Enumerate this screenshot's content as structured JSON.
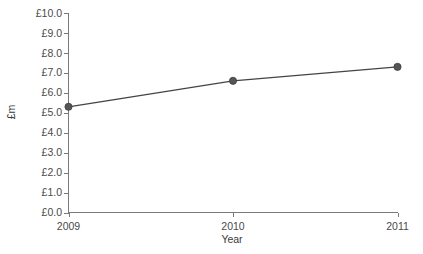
{
  "chart_data": {
    "type": "line",
    "title": "",
    "xlabel": "Year",
    "ylabel": "£m",
    "categories": [
      "2009",
      "2010",
      "2011"
    ],
    "x": [
      2009,
      2010,
      2011
    ],
    "values": [
      5.3,
      6.6,
      7.3
    ],
    "series": [
      {
        "name": "£m",
        "values": [
          5.3,
          6.6,
          7.3
        ]
      }
    ],
    "ylim": [
      0.0,
      10.0
    ],
    "ytick_step": 1.0,
    "ytick_labels": [
      "£10.0",
      "£9.0",
      "£8.0",
      "£7.0",
      "£6.0",
      "£5.0",
      "£4.0",
      "£3.0",
      "£2.0",
      "£1.0",
      "£0.0"
    ],
    "ytick_values": [
      10.0,
      9.0,
      8.0,
      7.0,
      6.0,
      5.0,
      4.0,
      3.0,
      2.0,
      1.0,
      0.0
    ],
    "xtick_labels": [
      "2009",
      "2010",
      "2011"
    ],
    "grid": false,
    "legend": false,
    "colors": {
      "line": "#444444",
      "marker": "#555555",
      "axis": "#7a7a7a",
      "text": "#3a3a3a",
      "background": "#ffffff"
    }
  }
}
